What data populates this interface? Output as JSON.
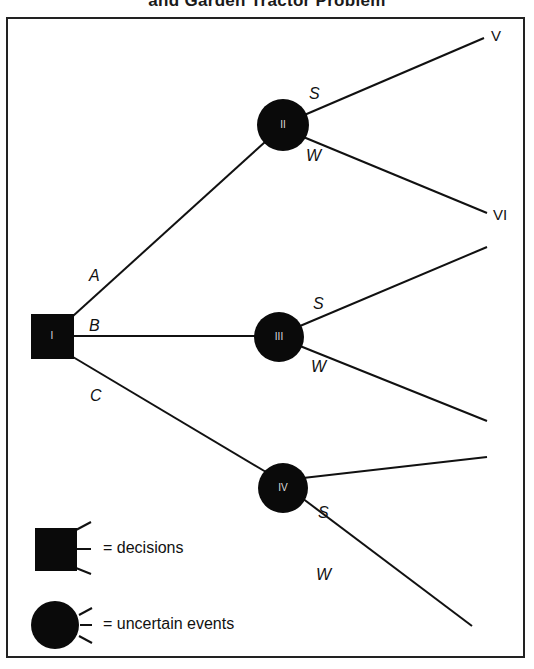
{
  "figure": {
    "title": "and Garden Tractor Problem"
  },
  "nodes": {
    "decision": {
      "id": "I",
      "type": "decision"
    },
    "chance": [
      {
        "id": "II",
        "type": "uncertain-event"
      },
      {
        "id": "III",
        "type": "uncertain-event"
      },
      {
        "id": "IV",
        "type": "uncertain-event"
      }
    ]
  },
  "branches": {
    "decision": [
      {
        "label": "A",
        "to": "II"
      },
      {
        "label": "B",
        "to": "III"
      },
      {
        "label": "C",
        "to": "IV"
      }
    ],
    "chance": {
      "II": [
        {
          "label": "S",
          "outcome": "V"
        },
        {
          "label": "W",
          "outcome": "VI"
        }
      ],
      "III": [
        {
          "label": "S"
        },
        {
          "label": "W"
        }
      ],
      "IV": [
        {
          "label": "S"
        },
        {
          "label": "W"
        }
      ]
    }
  },
  "legend": {
    "decisions": "= decisions",
    "uncertain_events": "= uncertain events"
  },
  "colors": {
    "ink": "#111111",
    "background": "#ffffff"
  }
}
